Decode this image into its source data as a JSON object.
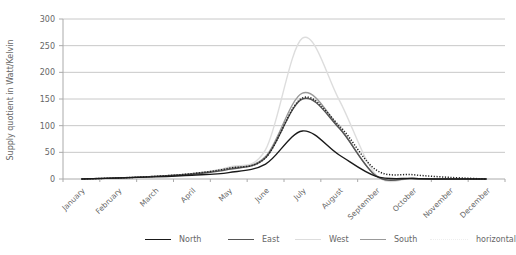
{
  "chart_data": {
    "type": "line",
    "title": "",
    "xlabel": "",
    "ylabel": "Supply quotient in Watt/Kelvin",
    "ylim": [
      0,
      300
    ],
    "yticks": [
      0,
      50,
      100,
      150,
      200,
      250,
      300
    ],
    "grid": true,
    "legend_position": "bottom",
    "categories": [
      "January",
      "February",
      "March",
      "April",
      "May",
      "June",
      "July",
      "August",
      "September",
      "October",
      "November",
      "December"
    ],
    "series": [
      {
        "name": "North",
        "color": "#1a1a1a",
        "style": "solid",
        "values": [
          0,
          2,
          4,
          7,
          12,
          28,
          90,
          45,
          5,
          1,
          0,
          0
        ]
      },
      {
        "name": "East",
        "color": "#555555",
        "style": "solid",
        "values": [
          0,
          2,
          5,
          9,
          18,
          40,
          150,
          95,
          6,
          1,
          0,
          0
        ]
      },
      {
        "name": "West",
        "color": "#dddddd",
        "style": "solid",
        "values": [
          0,
          2,
          5,
          10,
          22,
          55,
          264,
          148,
          8,
          1,
          0,
          0
        ]
      },
      {
        "name": "South",
        "color": "#999999",
        "style": "solid",
        "values": [
          0,
          2,
          5,
          10,
          20,
          42,
          161,
          97,
          6,
          1,
          0,
          0
        ]
      },
      {
        "name": "horizontal",
        "color": "#222222",
        "style": "dotted",
        "values": [
          0,
          2,
          5,
          10,
          20,
          40,
          152,
          100,
          17,
          8,
          3,
          0
        ]
      }
    ]
  }
}
